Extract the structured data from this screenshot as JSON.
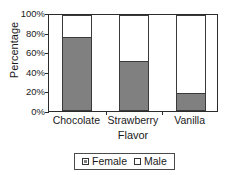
{
  "chart_data": {
    "type": "bar",
    "subtype": "stacked-100-percent",
    "title": "",
    "xlabel": "Flavor",
    "ylabel": "Percentage",
    "categories": [
      "Chocolate",
      "Strawberry",
      "Vanilla"
    ],
    "series": [
      {
        "name": "Female",
        "values": [
          76,
          51,
          18
        ],
        "color": "#808080"
      },
      {
        "name": "Male",
        "values": [
          24,
          49,
          82
        ],
        "color": "#ffffff"
      }
    ],
    "ylim": [
      0,
      100
    ],
    "y_ticks": [
      0,
      20,
      40,
      60,
      80,
      100
    ],
    "y_tick_labels": [
      "0%",
      "20%",
      "40%",
      "60%",
      "80%",
      "100%"
    ],
    "grid": false,
    "legend_position": "bottom",
    "legend_entries": [
      "Female",
      "Male"
    ],
    "border_color": "#2b2b2b",
    "plot_background": "#ffffff"
  },
  "axes": {
    "y_title": "Percentage",
    "x_title": "Flavor"
  }
}
